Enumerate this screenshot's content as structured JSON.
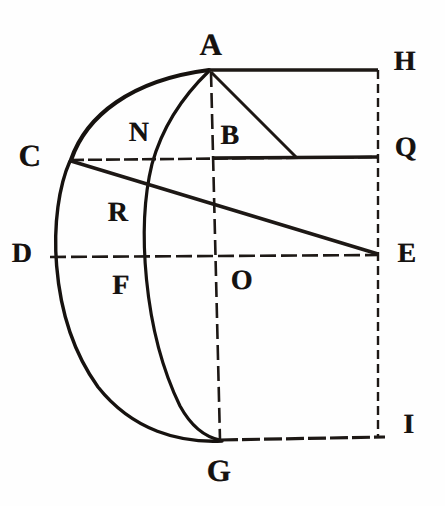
{
  "figure": {
    "kind": "classical-geometry-plate",
    "ink_color": "#16120f",
    "paper_color": "#fefefe",
    "width": 445,
    "height": 506
  },
  "points": [
    {
      "id": "A",
      "label": "A",
      "lx": 211,
      "ly": 44,
      "px": 210,
      "py": 70,
      "size": "lg"
    },
    {
      "id": "H",
      "label": "H",
      "lx": 405,
      "ly": 62,
      "px": 378,
      "py": 70,
      "size": "md"
    },
    {
      "id": "K",
      "label": "N",
      "lx": 139,
      "ly": 133,
      "px": 157,
      "py": 157,
      "size": "md"
    },
    {
      "id": "B",
      "label": "B",
      "lx": 230,
      "ly": 136,
      "px": 214,
      "py": 157,
      "size": "md"
    },
    {
      "id": "Q",
      "label": "Q",
      "lx": 406,
      "ly": 148,
      "px": 378,
      "py": 157,
      "size": "md"
    },
    {
      "id": "C",
      "label": "C",
      "lx": 30,
      "ly": 155,
      "px": 70,
      "py": 160,
      "size": "lg"
    },
    {
      "id": "R",
      "label": "R",
      "lx": 118,
      "ly": 213,
      "px": 130,
      "py": 205,
      "size": "md"
    },
    {
      "id": "D",
      "label": "D",
      "lx": 22,
      "ly": 254,
      "px": 50,
      "py": 256,
      "size": "md"
    },
    {
      "id": "E",
      "label": "E",
      "lx": 407,
      "ly": 254,
      "px": 378,
      "py": 256,
      "size": "md"
    },
    {
      "id": "F",
      "label": "F",
      "lx": 121,
      "ly": 286,
      "px": 145,
      "py": 256,
      "size": "md"
    },
    {
      "id": "O",
      "label": "O",
      "lx": 242,
      "ly": 281,
      "px": 219,
      "py": 256,
      "size": "md"
    },
    {
      "id": "I",
      "label": "I",
      "lx": 409,
      "ly": 425,
      "px": 378,
      "py": 437,
      "size": "md"
    },
    {
      "id": "G",
      "label": "G",
      "lx": 219,
      "ly": 470,
      "px": 220,
      "py": 440,
      "size": "lg"
    }
  ],
  "segments": [
    {
      "id": "AH",
      "name": "top-edge-A-H",
      "d": "M 209 70 L 378 70",
      "w": 3.6,
      "dash": "none"
    },
    {
      "id": "HI",
      "name": "right-edge-H-I",
      "d": "M 378 70 L 378 437",
      "w": 2.4,
      "dash": "9 5"
    },
    {
      "id": "GI",
      "name": "bottom-edge-G-I",
      "d": "M 220 440 L 385 437",
      "w": 3.2,
      "dash": "18 4"
    },
    {
      "id": "CQ",
      "name": "horizontal-chord-C-Q",
      "d": "M 70 160 L 378 157",
      "w": 2.6,
      "dash": "14 4"
    },
    {
      "id": "DE",
      "name": "horizontal-diameter-D-E",
      "d": "M 50 257 L 378 255",
      "w": 2.6,
      "dash": "16 5"
    },
    {
      "id": "AG",
      "name": "vertical-axis-A-G",
      "d": "M 211 72 L 220 440",
      "w": 2.6,
      "dash": "15 6"
    },
    {
      "id": "CE",
      "name": "diagonal-C-to-E",
      "d": "M 71 161 L 378 254",
      "w": 3.4,
      "dash": "none"
    },
    {
      "id": "AQ",
      "name": "diagonal-A-to-chord",
      "d": "M 211 72 L 296 157",
      "w": 3.0,
      "dash": "none"
    },
    {
      "id": "BQ",
      "name": "chord-segment-B-Q",
      "d": "M 214 158 L 378 157",
      "w": 3.4,
      "dash": "none"
    }
  ],
  "arcs": [
    {
      "id": "arc-CA",
      "name": "outer-arc-C-to-A",
      "d": "M 71 160 C 86 116, 131 80, 209 70",
      "w": 4.2
    },
    {
      "id": "arc-CDG",
      "name": "outer-arc-C-D-G",
      "d": "M 70 161 C 48 210, 47 316, 98 387 C 133 431, 180 443, 222 441",
      "w": 3.4
    },
    {
      "id": "arc-AKG",
      "name": "inner-arc-A-through-K-to-G",
      "d": "M 209 71 C 182 97, 162 128, 152 164 C 137 225, 143 330, 180 406 C 191 426, 205 437, 220 440",
      "w": 3.2
    }
  ],
  "labels_note": "Point letters as engraved on the plate"
}
